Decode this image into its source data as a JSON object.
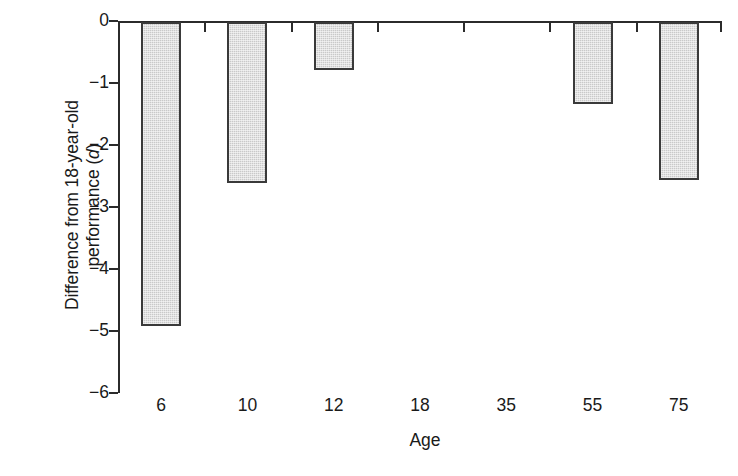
{
  "chart_data": {
    "type": "bar",
    "title": "",
    "subtitle": "",
    "xlabel": "Age",
    "ylabel": "Difference from 18-year-old performance (d)",
    "ylabel_line1": "Difference from 18-year-old",
    "ylabel_line2_prefix": "performance (",
    "ylabel_line2_italic": "d",
    "ylabel_line2_suffix": ")",
    "categories": [
      "6",
      "10",
      "12",
      "18",
      "35",
      "55",
      "75"
    ],
    "values": [
      -4.9,
      -2.6,
      -0.78,
      0,
      0,
      -1.32,
      -2.55
    ],
    "series": [
      {
        "name": "Difference from 18-year-old performance",
        "values": [
          -4.9,
          -2.6,
          -0.78,
          0,
          0,
          -1.32,
          -2.55
        ]
      }
    ],
    "ylim": [
      -6,
      0
    ],
    "ytick_labels": [
      "0",
      "−1",
      "−2",
      "−3",
      "−4",
      "−5",
      "−6"
    ],
    "ytick_values": [
      0,
      -1,
      -2,
      -3,
      -4,
      -5,
      -6
    ],
    "grid": false,
    "legend": "none",
    "orientation": "vertical",
    "bar_fill_color": "#c9c9c9",
    "bar_edge_color": "#3a3a3a",
    "axis_color": "#2b2b2b",
    "background_color": "#ffffff"
  }
}
